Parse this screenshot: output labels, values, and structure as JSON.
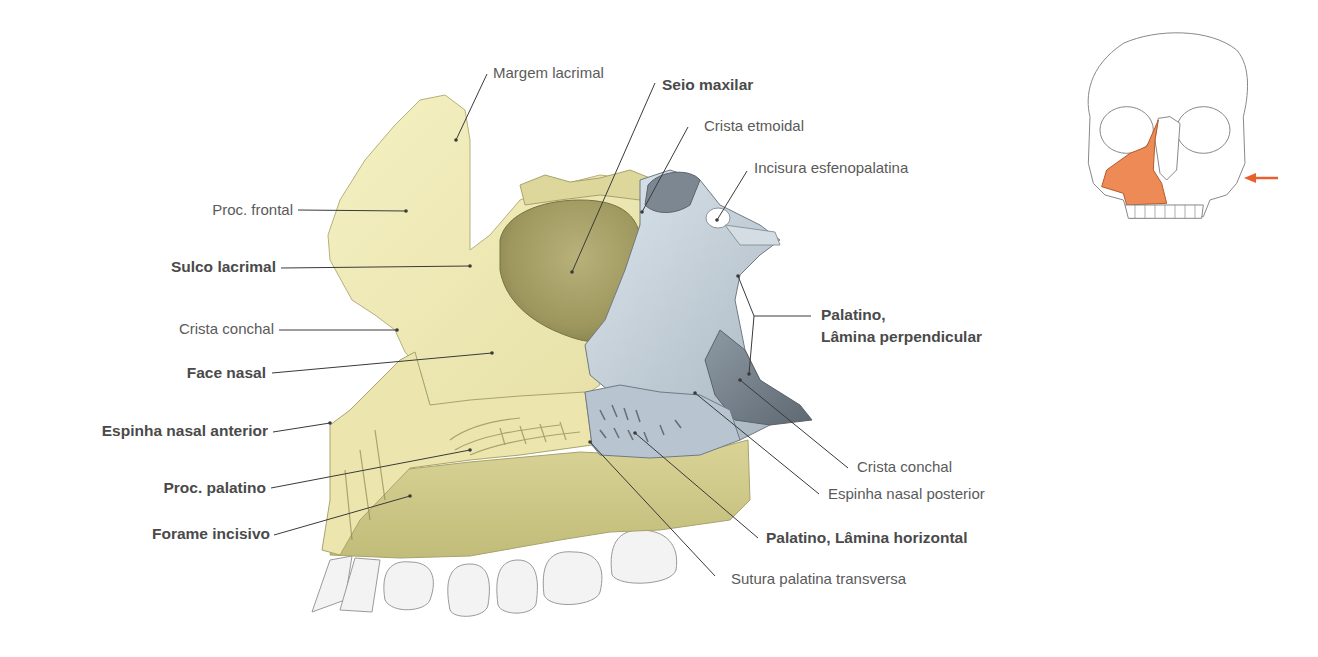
{
  "figure": {
    "colors": {
      "maxilla": "#f1edb8",
      "maxilla_shade": "#c9c488",
      "sinus": "#a8a266",
      "palatine": "#c9d6e0",
      "palatine_shade": "#7d8a96",
      "teeth": "#f2f2f2",
      "leader": "#3a3a3a",
      "highlight": "#ee8a55",
      "arrow": "#e9602c"
    },
    "labels_left": [
      {
        "id": "proc-frontal",
        "text": "Proc. frontal",
        "bold": false
      },
      {
        "id": "sulco-lacrimal",
        "text": "Sulco lacrimal",
        "bold": true
      },
      {
        "id": "crista-conchal-left",
        "text": "Crista  conchal",
        "bold": false
      },
      {
        "id": "face-nasal",
        "text": "Face nasal",
        "bold": true
      },
      {
        "id": "espinha-nasal-anterior",
        "text": "Espinha nasal anterior",
        "bold": true
      },
      {
        "id": "proc-palatino",
        "text": "Proc. palatino",
        "bold": true
      },
      {
        "id": "forame-incisivo",
        "text": "Forame incisivo",
        "bold": true
      }
    ],
    "labels_top": [
      {
        "id": "margem-lacrimal",
        "text": "Margem lacrimal",
        "bold": false
      },
      {
        "id": "seio-maxilar",
        "text": "Seio maxilar",
        "bold": true
      },
      {
        "id": "crista-etmoidal",
        "text": "Crista etmoidal",
        "bold": false
      },
      {
        "id": "incisura-esfenopalatina",
        "text": "Incisura esfenopalatina",
        "bold": false
      }
    ],
    "labels_right": [
      {
        "id": "palatino-lamina-perpendicular",
        "line1": "Palatino,",
        "line2": "Lâmina perpendicular",
        "bold": true
      },
      {
        "id": "crista-conchal-right",
        "text": "Crista conchal",
        "bold": false
      },
      {
        "id": "espinha-nasal-posterior",
        "text": "Espinha nasal posterior",
        "bold": false
      },
      {
        "id": "palatino-lamina-horizontal",
        "text": "Palatino, Lâmina horizontal",
        "bold": true
      },
      {
        "id": "sutura-palatina-transversa",
        "text": "Sutura palatina transversa",
        "bold": false
      }
    ],
    "inset": {
      "description": "Skull frontal view with right maxilla highlighted",
      "arrow_direction": "left"
    }
  }
}
